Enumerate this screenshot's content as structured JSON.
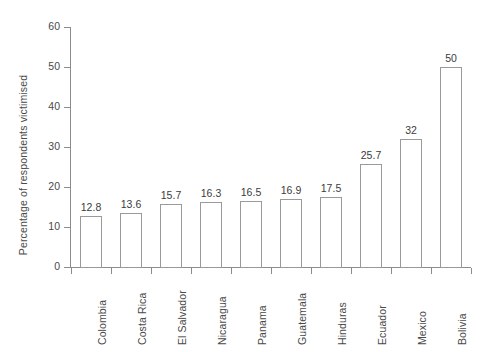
{
  "chart_data": {
    "type": "bar",
    "title": "",
    "xlabel": "",
    "ylabel": "Percentage of respondents victimised",
    "ylim": [
      0,
      60
    ],
    "yticks": [
      0,
      10,
      20,
      30,
      40,
      50,
      60
    ],
    "grid": false,
    "legend": null,
    "categories": [
      "Colombia",
      "Costa Rica",
      "El Salvador",
      "Nicaragua",
      "Panama",
      "Guatemala",
      "Hinduras",
      "Ecuador",
      "Mexico",
      "Bolivia"
    ],
    "values": [
      12.8,
      13.6,
      15.7,
      16.3,
      16.5,
      16.9,
      17.5,
      25.7,
      32,
      50
    ],
    "value_labels": [
      "12.8",
      "13.6",
      "15.7",
      "16.3",
      "16.5",
      "16.9",
      "17.5",
      "25.7",
      "32",
      "50"
    ],
    "bar_style": {
      "fill": "#ffffff",
      "outline": "#9a9a9a"
    },
    "axis_color": "#8c8c8c",
    "text_color": "#4a4a4a",
    "background": "#ffffff"
  }
}
